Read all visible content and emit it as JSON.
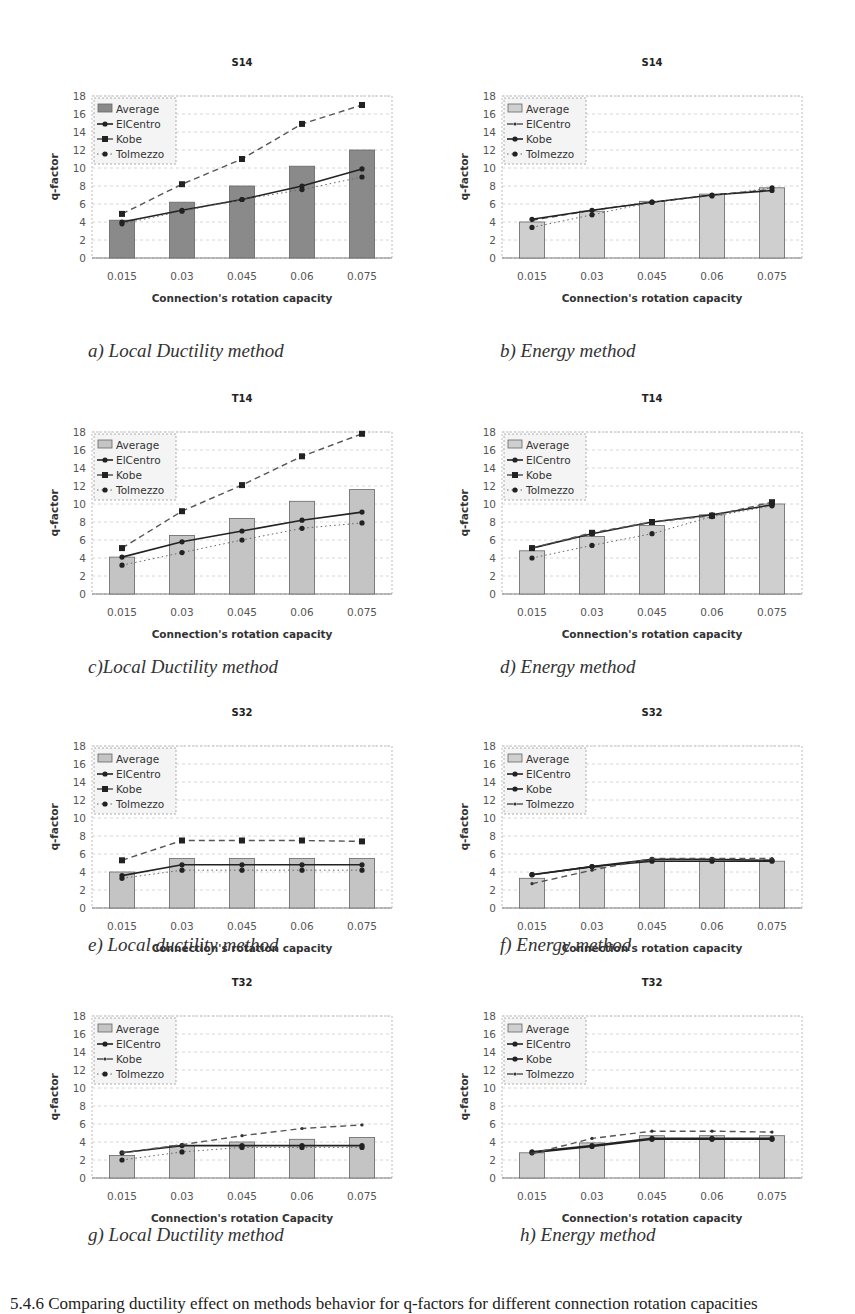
{
  "figure": {
    "bottom_caption": "5.4.6 Comparing ductility effect on methods behavior for q-factors for different connection rotation capacities"
  },
  "legend": [
    "Average",
    "ElCentro",
    "Kobe",
    "Tolmezzo"
  ],
  "chart_data": [
    {
      "id": "a",
      "type": "bar+line",
      "title": "S14",
      "caption": "a) Local Ductility method",
      "xlabel": "Connection's rotation capacity",
      "ylabel": "q-factor",
      "ylim": [
        0,
        18
      ],
      "yticks": [
        0,
        2,
        4,
        6,
        8,
        10,
        12,
        14,
        16,
        18
      ],
      "categories": [
        "0.015",
        "0.03",
        "0.045",
        "0.06",
        "0.075"
      ],
      "grid": true,
      "legend_position": "top-left",
      "bar_color": "#8a8a8a",
      "series": [
        {
          "name": "Average",
          "kind": "bar",
          "values": [
            4.2,
            6.2,
            8.0,
            10.2,
            12.0
          ]
        },
        {
          "name": "ElCentro",
          "kind": "line-solid",
          "values": [
            4.0,
            5.3,
            6.5,
            8.0,
            9.9
          ]
        },
        {
          "name": "Kobe",
          "kind": "line-dashed-square",
          "values": [
            4.9,
            8.2,
            11.0,
            14.9,
            17.0
          ]
        },
        {
          "name": "Tolmezzo",
          "kind": "line-dotted",
          "values": [
            3.8,
            5.2,
            6.5,
            7.6,
            9.0
          ]
        }
      ]
    },
    {
      "id": "b",
      "type": "bar+line",
      "title": "S14",
      "caption": "b) Energy method",
      "xlabel": "Connection's rotation capacity",
      "ylabel": "q-factor",
      "ylim": [
        0,
        18
      ],
      "yticks": [
        0,
        2,
        4,
        6,
        8,
        10,
        12,
        14,
        16,
        18
      ],
      "categories": [
        "0.015",
        "0.03",
        "0.045",
        "0.06",
        "0.075"
      ],
      "grid": true,
      "legend_position": "top-left",
      "bar_color": "#cfcfcf",
      "series": [
        {
          "name": "Average",
          "kind": "bar",
          "values": [
            4.0,
            5.2,
            6.3,
            7.1,
            7.8
          ]
        },
        {
          "name": "ElCentro",
          "kind": "line-dashed",
          "values": [
            4.2,
            5.3,
            6.2,
            7.0,
            7.6
          ]
        },
        {
          "name": "Kobe",
          "kind": "line-solid-dot",
          "values": [
            4.3,
            5.3,
            6.2,
            7.0,
            7.5
          ]
        },
        {
          "name": "Tolmezzo",
          "kind": "line-dotted",
          "values": [
            3.4,
            4.8,
            6.2,
            6.9,
            7.8
          ]
        }
      ]
    },
    {
      "id": "c",
      "type": "bar+line",
      "title": "T14",
      "caption": "c)Local Ductility method",
      "xlabel": "Connection's rotation capacity",
      "ylabel": "q-factor",
      "ylim": [
        0,
        18
      ],
      "yticks": [
        0,
        2,
        4,
        6,
        8,
        10,
        12,
        14,
        16,
        18
      ],
      "categories": [
        "0.015",
        "0.03",
        "0.045",
        "0.06",
        "0.075"
      ],
      "grid": true,
      "legend_position": "top-left",
      "bar_color": "#c4c4c4",
      "series": [
        {
          "name": "Average",
          "kind": "bar",
          "values": [
            4.1,
            6.5,
            8.4,
            10.3,
            11.6
          ]
        },
        {
          "name": "ElCentro",
          "kind": "line-solid",
          "values": [
            4.1,
            5.8,
            7.0,
            8.2,
            9.1
          ]
        },
        {
          "name": "Kobe",
          "kind": "line-dashed-square",
          "values": [
            5.1,
            9.2,
            12.1,
            15.3,
            17.8
          ]
        },
        {
          "name": "Tolmezzo",
          "kind": "line-dotted",
          "values": [
            3.2,
            4.6,
            6.0,
            7.3,
            7.9
          ]
        }
      ]
    },
    {
      "id": "d",
      "type": "bar+line",
      "title": "T14",
      "caption": "d) Energy method",
      "xlabel": "Connection's rotation capacity",
      "ylabel": "q-factor",
      "ylim": [
        0,
        18
      ],
      "yticks": [
        0,
        2,
        4,
        6,
        8,
        10,
        12,
        14,
        16,
        18
      ],
      "categories": [
        "0.015",
        "0.03",
        "0.045",
        "0.06",
        "0.075"
      ],
      "grid": true,
      "legend_position": "top-left",
      "bar_color": "#cfcfcf",
      "series": [
        {
          "name": "Average",
          "kind": "bar",
          "values": [
            4.8,
            6.4,
            7.6,
            8.8,
            10.0
          ]
        },
        {
          "name": "ElCentro",
          "kind": "line-solid",
          "values": [
            5.1,
            6.7,
            8.0,
            8.8,
            9.9
          ]
        },
        {
          "name": "Kobe",
          "kind": "line-dashed-square",
          "values": [
            5.1,
            6.8,
            8.0,
            8.7,
            10.2
          ]
        },
        {
          "name": "Tolmezzo",
          "kind": "line-dotted",
          "values": [
            4.0,
            5.4,
            6.7,
            8.6,
            9.8
          ]
        }
      ]
    },
    {
      "id": "e",
      "type": "bar+line",
      "title": "S32",
      "caption": "e) Local ductility method",
      "xlabel": "Connection's rotation capacity",
      "ylabel": "q-factor",
      "ylim": [
        0,
        18
      ],
      "yticks": [
        0,
        2,
        4,
        6,
        8,
        10,
        12,
        14,
        16,
        18
      ],
      "categories": [
        "0.015",
        "0.03",
        "0.045",
        "0.06",
        "0.075"
      ],
      "grid": true,
      "legend_position": "top-left",
      "bar_color": "#c4c4c4",
      "series": [
        {
          "name": "Average",
          "kind": "bar",
          "values": [
            4.0,
            5.5,
            5.5,
            5.5,
            5.5
          ]
        },
        {
          "name": "ElCentro",
          "kind": "line-solid",
          "values": [
            3.6,
            4.8,
            4.8,
            4.8,
            4.8
          ]
        },
        {
          "name": "Kobe",
          "kind": "line-dashed-square",
          "values": [
            5.3,
            7.5,
            7.5,
            7.5,
            7.4
          ]
        },
        {
          "name": "Tolmezzo",
          "kind": "line-dotted",
          "values": [
            3.3,
            4.2,
            4.2,
            4.2,
            4.2
          ]
        }
      ]
    },
    {
      "id": "f",
      "type": "bar+line",
      "title": "S32",
      "caption": "f) Energy method",
      "xlabel": "Connection's rotation capacity",
      "ylabel": "q-factor",
      "ylim": [
        0,
        18
      ],
      "yticks": [
        0,
        2,
        4,
        6,
        8,
        10,
        12,
        14,
        16,
        18
      ],
      "categories": [
        "0.015",
        "0.03",
        "0.045",
        "0.06",
        "0.075"
      ],
      "grid": true,
      "legend_position": "top-left",
      "bar_color": "#cfcfcf",
      "series": [
        {
          "name": "Average",
          "kind": "bar",
          "values": [
            3.3,
            4.5,
            5.2,
            5.2,
            5.2
          ]
        },
        {
          "name": "ElCentro",
          "kind": "line-solid",
          "values": [
            3.7,
            4.6,
            5.2,
            5.2,
            5.2
          ]
        },
        {
          "name": "Kobe",
          "kind": "line-solid-dot",
          "values": [
            3.7,
            4.6,
            5.4,
            5.4,
            5.3
          ]
        },
        {
          "name": "Tolmezzo",
          "kind": "line-dashed",
          "values": [
            2.7,
            4.2,
            5.5,
            5.5,
            5.5
          ]
        }
      ]
    },
    {
      "id": "g",
      "type": "bar+line",
      "title": "T32",
      "caption": "g) Local Ductility method",
      "xlabel": "Connection's rotation Capacity",
      "ylabel": "q-factor",
      "ylim": [
        0,
        18
      ],
      "yticks": [
        0,
        2,
        4,
        6,
        8,
        10,
        12,
        14,
        16,
        18
      ],
      "categories": [
        "0.015",
        "0.03",
        "0.045",
        "0.06",
        "0.075"
      ],
      "grid": true,
      "legend_position": "top-left",
      "bar_color": "#c4c4c4",
      "series": [
        {
          "name": "Average",
          "kind": "bar",
          "values": [
            2.5,
            3.6,
            4.0,
            4.3,
            4.5
          ]
        },
        {
          "name": "ElCentro",
          "kind": "line-solid",
          "values": [
            2.8,
            3.6,
            3.6,
            3.6,
            3.6
          ]
        },
        {
          "name": "Kobe",
          "kind": "line-dashed",
          "values": [
            2.8,
            3.7,
            4.7,
            5.5,
            5.9
          ]
        },
        {
          "name": "Tolmezzo",
          "kind": "line-dotted",
          "values": [
            2.0,
            2.9,
            3.4,
            3.4,
            3.4
          ]
        }
      ]
    },
    {
      "id": "h",
      "type": "bar+line",
      "title": "T32",
      "caption": "h) Energy method",
      "xlabel": "Connection's rotation capacity",
      "ylabel": "q-factor",
      "ylim": [
        0,
        18
      ],
      "yticks": [
        0,
        2,
        4,
        6,
        8,
        10,
        12,
        14,
        16,
        18
      ],
      "categories": [
        "0.015",
        "0.03",
        "0.045",
        "0.06",
        "0.075"
      ],
      "grid": true,
      "legend_position": "top-left",
      "bar_color": "#cfcfcf",
      "series": [
        {
          "name": "Average",
          "kind": "bar",
          "values": [
            2.8,
            3.9,
            4.7,
            4.7,
            4.7
          ]
        },
        {
          "name": "ElCentro",
          "kind": "line-solid",
          "values": [
            2.8,
            3.5,
            4.3,
            4.3,
            4.3
          ]
        },
        {
          "name": "Kobe",
          "kind": "line-solid-dot",
          "values": [
            2.9,
            3.6,
            4.4,
            4.4,
            4.4
          ]
        },
        {
          "name": "Tolmezzo",
          "kind": "line-dashed",
          "values": [
            2.7,
            4.4,
            5.2,
            5.2,
            5.1
          ]
        }
      ]
    }
  ]
}
